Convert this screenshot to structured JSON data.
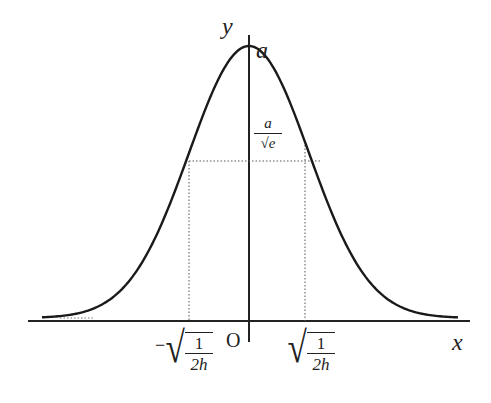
{
  "chart_data": {
    "type": "line",
    "title": "",
    "xlabel": "x",
    "ylabel": "y",
    "origin_label": "O",
    "peak_label": "a",
    "inflection_y_label": {
      "numerator": "a",
      "denominator": "√e"
    },
    "inflection_x_labels": [
      {
        "sign": "−",
        "numerator": "1",
        "denominator": "2h",
        "text": "−√(1/(2h))"
      },
      {
        "sign": "",
        "numerator": "1",
        "denominator": "2h",
        "text": "√(1/(2h))"
      }
    ],
    "series": [
      {
        "name": "y = a·e^(−h x²)",
        "x": [
          -3,
          -2.5,
          -2,
          -1.5,
          -1,
          -0.5,
          0,
          0.5,
          1,
          1.5,
          2,
          2.5,
          3
        ],
        "values": [
          0.011,
          0.044,
          0.135,
          0.325,
          0.607,
          0.882,
          1,
          0.882,
          0.607,
          0.325,
          0.135,
          0.044,
          0.011
        ]
      }
    ],
    "grid": false,
    "legend": false,
    "guides": "dotted lines from inflection points to axes"
  },
  "labels": {
    "y_axis": "y",
    "x_axis": "x",
    "origin": "O",
    "peak": "a",
    "frac_num": "a",
    "frac_den": "√e",
    "root_num": "1",
    "root_den": "2h",
    "minus": "−"
  },
  "colors": {
    "curve": "#1a1a1a",
    "axis": "#222222",
    "guide": "#555555"
  }
}
